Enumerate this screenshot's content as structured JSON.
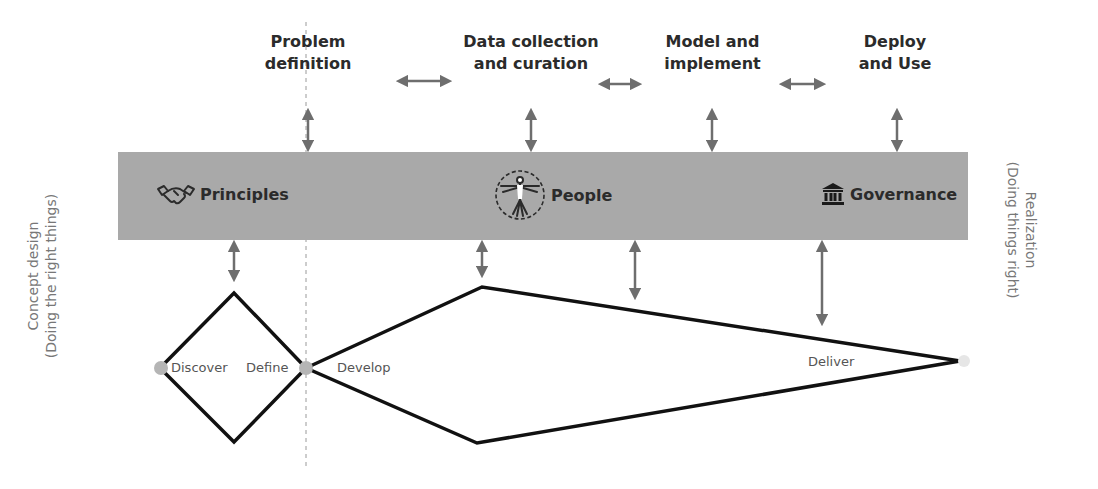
{
  "stages": [
    {
      "id": "problem-definition",
      "label": "Problem\ndefinition"
    },
    {
      "id": "data-collection",
      "label": "Data collection\nand curation"
    },
    {
      "id": "model-implement",
      "label": "Model and\nimplement"
    },
    {
      "id": "deploy-use",
      "label": "Deploy\nand Use"
    }
  ],
  "pillars": [
    {
      "id": "principles",
      "label": "Principles",
      "icon": "handshake-icon"
    },
    {
      "id": "people",
      "label": "People",
      "icon": "vitruvian-man-icon"
    },
    {
      "id": "governance",
      "label": "Governance",
      "icon": "institution-icon"
    }
  ],
  "side_labels": {
    "left": "Concept design\n(Doing the right things)",
    "right": "Realization\n(Doing things right)"
  },
  "phases": {
    "discover": "Discover",
    "define": "Define",
    "develop": "Develop",
    "deliver": "Deliver"
  },
  "colors": {
    "band": "#a9a9a9",
    "arrow": "#6e6e6e",
    "diamond_stroke": "#111111",
    "node": "#b5b5b5",
    "divider": "#9a9a9a"
  }
}
